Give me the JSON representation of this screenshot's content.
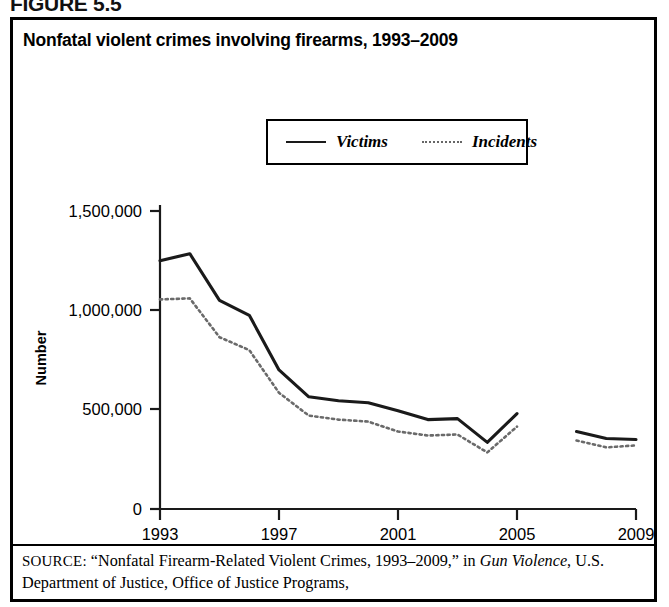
{
  "figure": {
    "label": "FIGURE 5.5",
    "title": "Nonfatal violent crimes involving firearms, 1993–2009"
  },
  "legend": {
    "position": "top-center-inside-plot",
    "entries": [
      {
        "label": "Victims",
        "style": "solid",
        "color": "#1a1a1a"
      },
      {
        "label": "Incidents",
        "style": "dotted",
        "color": "#666666"
      }
    ]
  },
  "axes": {
    "y_label": "Number",
    "y_ticks": [
      "0",
      "500,000",
      "1,000,000",
      "1,500,000"
    ],
    "x_ticks": [
      "1993",
      "1997",
      "2001",
      "2005",
      "2009"
    ]
  },
  "source": {
    "keyword": "SOURCE:",
    "quoted_title": "“Nonfatal Firearm-Related Violent Crimes, 1993–2009,” in",
    "italic_work": "Gun Violence",
    "rest": ", U.S. Department of Justice, Office of Justice Programs,"
  },
  "chart_data": {
    "type": "line",
    "title": "Nonfatal violent crimes involving firearms, 1993–2009",
    "xlabel": "",
    "ylabel": "Number",
    "xlim": [
      1993,
      2009
    ],
    "ylim": [
      0,
      1500000
    ],
    "ytick_values": [
      0,
      500000,
      1000000,
      1500000
    ],
    "xtick_values": [
      1993,
      1997,
      2001,
      2005,
      2009
    ],
    "grid": false,
    "legend_position": "upper center",
    "x": [
      1993,
      1994,
      1995,
      1996,
      1997,
      1998,
      1999,
      2000,
      2001,
      2002,
      2003,
      2004,
      2005,
      2007,
      2008,
      2009
    ],
    "note": "Data break between 2005 and 2007; no 2006 data point plotted.",
    "series": [
      {
        "name": "Victims",
        "style": "solid",
        "color": "#1a1a1a",
        "values": [
          1250000,
          1285000,
          1050000,
          975000,
          700000,
          565000,
          545000,
          535000,
          495000,
          450000,
          455000,
          335000,
          480000,
          390000,
          355000,
          350000
        ]
      },
      {
        "name": "Incidents",
        "style": "dotted",
        "color": "#666666",
        "values": [
          1055000,
          1060000,
          865000,
          800000,
          585000,
          470000,
          450000,
          440000,
          390000,
          370000,
          375000,
          285000,
          415000,
          345000,
          310000,
          320000
        ]
      }
    ]
  }
}
